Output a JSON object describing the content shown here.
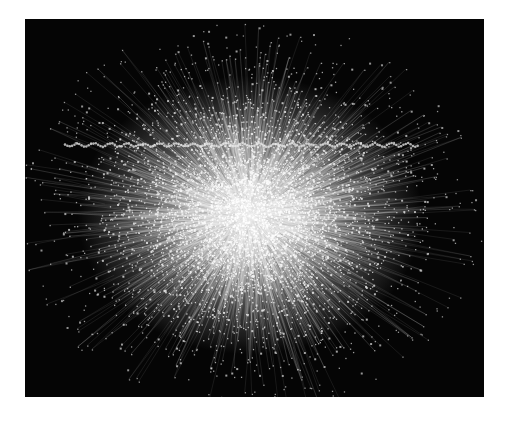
{
  "figure": {
    "kind": "network-graph",
    "colors": {
      "background": "#050505",
      "node": "#e8e8e8",
      "edge": "#bdbdbd",
      "page": "#ffffff"
    },
    "generation": {
      "seed": 20231,
      "node_count": 5200,
      "edge_count": 3600,
      "chain_band_nodes": 150
    }
  }
}
